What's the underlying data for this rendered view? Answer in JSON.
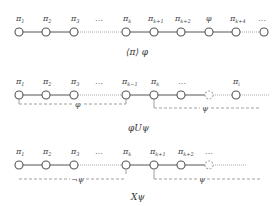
{
  "diagrams": [
    {
      "caption": "⟨π⟩ φ",
      "labels": [
        "π",
        "π",
        "π",
        "…",
        "π",
        "π",
        "π",
        "φ",
        "π",
        "…"
      ],
      "subscripts": [
        "1",
        "2",
        "3",
        "",
        "k",
        "k+1",
        "k+2",
        "",
        "k+4",
        ""
      ]
    },
    {
      "caption": "φUψ",
      "labels": [
        "π",
        "π",
        "π",
        "…",
        "π",
        "π",
        "…",
        "π"
      ],
      "subscripts": [
        "1",
        "2",
        "3",
        "",
        "k−1",
        "k",
        "",
        "i"
      ],
      "span_left_label": "φ",
      "span_right_label": "ψ"
    },
    {
      "caption": "Xψ",
      "labels": [
        "π",
        "π",
        "π",
        "…",
        "π",
        "π",
        "π",
        "…"
      ],
      "subscripts": [
        "1",
        "2",
        "3",
        "",
        "k",
        "k+1",
        "k+2",
        ""
      ],
      "span_left_label": "¬ψ",
      "span_right_label": "ψ"
    }
  ]
}
